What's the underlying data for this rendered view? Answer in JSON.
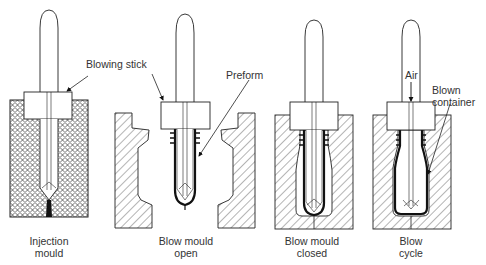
{
  "diagram": {
    "stages": [
      {
        "id": "injection",
        "caption_line1": "Injection",
        "caption_line2": "mould"
      },
      {
        "id": "blow-open",
        "caption_line1": "Blow mould",
        "caption_line2": "open"
      },
      {
        "id": "blow-closed",
        "caption_line1": "Blow mould",
        "caption_line2": "closed"
      },
      {
        "id": "blow-cycle",
        "caption_line1": "Blow",
        "caption_line2": "cycle"
      }
    ],
    "callouts": {
      "blowing_stick": "Blowing stick",
      "preform": "Preform",
      "air": "Air",
      "blown_container_line1": "Blown",
      "blown_container_line2": "container"
    },
    "colors": {
      "line": "#222222",
      "hatch": "#444444",
      "background": "#ffffff"
    }
  }
}
